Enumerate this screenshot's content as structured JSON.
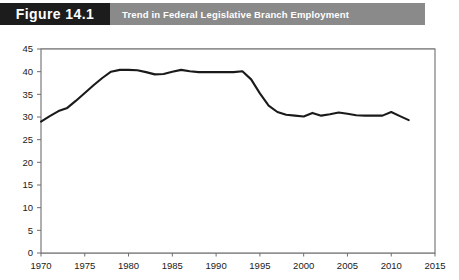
{
  "header": {
    "figure_number": "Figure 14.1",
    "title": "Trend in Federal Legislative Branch Employment",
    "number_box_color": "#1c1c1c",
    "band_color": "#8a8a8a",
    "text_color": "#ffffff"
  },
  "chart_data": {
    "type": "line",
    "title": "Trend in Federal Legislative Branch Employment",
    "xlabel": "",
    "ylabel": "",
    "xlim": [
      1970,
      2015
    ],
    "ylim": [
      0,
      45
    ],
    "grid": true,
    "grid_axis": "y",
    "legend": false,
    "line_color": "#1a1a1a",
    "line_width": 2.1,
    "plot_background": "#ffffff",
    "axis_color": "#6e6e6e",
    "x_ticks": [
      1970,
      1975,
      1980,
      1985,
      1990,
      1995,
      2000,
      2005,
      2010,
      2015
    ],
    "x_tick_labels": [
      "1970",
      "1975",
      "1980",
      "1985",
      "1990",
      "1995",
      "2000",
      "2005",
      "2010",
      "2015"
    ],
    "y_ticks": [
      0,
      5,
      10,
      15,
      20,
      25,
      30,
      35,
      40,
      45
    ],
    "y_tick_labels": [
      "0",
      "5",
      "10",
      "15",
      "20",
      "25",
      "30",
      "35",
      "40",
      "45"
    ],
    "series": [
      {
        "name": "Federal Legislative Branch Employment (thousands)",
        "x": [
          1970,
          1971,
          1972,
          1973,
          1974,
          1975,
          1976,
          1977,
          1978,
          1979,
          1980,
          1981,
          1982,
          1983,
          1984,
          1985,
          1986,
          1987,
          1988,
          1989,
          1990,
          1991,
          1992,
          1993,
          1994,
          1995,
          1996,
          1997,
          1998,
          1999,
          2000,
          2001,
          2002,
          2003,
          2004,
          2005,
          2006,
          2007,
          2008,
          2009,
          2010,
          2011,
          2012
        ],
        "values": [
          29.0,
          30.2,
          31.3,
          32.0,
          33.6,
          35.3,
          37.0,
          38.6,
          40.0,
          40.4,
          40.4,
          40.3,
          39.9,
          39.4,
          39.5,
          40.0,
          40.4,
          40.1,
          39.9,
          39.9,
          39.9,
          39.9,
          39.9,
          40.1,
          38.3,
          35.2,
          32.5,
          31.1,
          30.5,
          30.3,
          30.1,
          30.9,
          30.3,
          30.6,
          31.0,
          30.7,
          30.4,
          30.3,
          30.3,
          30.3,
          31.1,
          30.2,
          29.3
        ]
      }
    ]
  }
}
